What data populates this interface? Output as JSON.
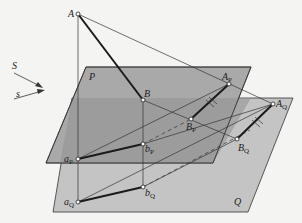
{
  "diagram": {
    "colors": {
      "background": "#f4f4f2",
      "plane_p": "#a9a9a9",
      "plane_q": "#c4c4c4",
      "plane_overlap": "#8e8e8e",
      "line": "#333333",
      "thick_line": "#1a1a1a"
    },
    "labels": {
      "direction_S": "S",
      "direction_s": "s",
      "plane_P": "P",
      "plane_Q": "Q",
      "A": "A",
      "B": "B",
      "A_P_main": "A",
      "A_P_sub": "P",
      "B_P_main": "B",
      "B_P_sub": "P",
      "A_Q_main": "A",
      "A_Q_sub": "Q",
      "B_Q_main": "B",
      "B_Q_sub": "Q",
      "a_P_main": "a",
      "a_P_sub": "P",
      "b_P_main": "b",
      "b_P_sub": "P",
      "a_Q_main": "a",
      "a_Q_sub": "Q",
      "b_Q_main": "b",
      "b_Q_sub": "Q"
    }
  }
}
